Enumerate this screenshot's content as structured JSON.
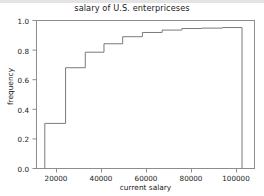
{
  "figure": {
    "width": 264,
    "height": 196,
    "background": "#ffffff",
    "top_band_color": "#e4e4e4"
  },
  "chart_data": {
    "type": "line",
    "title": "salary of U.S. enterpriceses",
    "xlabel": "current salary",
    "ylabel": "frequency",
    "xlim": [
      11000,
      116000
    ],
    "ylim": [
      0.0,
      1.05
    ],
    "grid": false,
    "legend": null,
    "line_color": "#7a7a7a",
    "line_width": 1.0,
    "xticks": [
      20000,
      40000,
      60000,
      80000,
      100000
    ],
    "xtick_labels": [
      "20000",
      "40000",
      "60000",
      "80000",
      "100000"
    ],
    "yticks": [
      0.0,
      0.2,
      0.4,
      0.6,
      0.8,
      1.0
    ],
    "ytick_labels": [
      "0.0",
      "0.2",
      "0.4",
      "0.6",
      "0.8",
      "1.0"
    ],
    "x": [
      15000,
      15000,
      25000,
      25000,
      34500,
      34500,
      43500,
      43500,
      52500,
      52500,
      62000,
      62000,
      71500,
      71500,
      81000,
      81000,
      90500,
      90500,
      100500,
      100500,
      110000,
      110000
    ],
    "y": [
      0.0,
      0.32,
      0.32,
      0.715,
      0.715,
      0.825,
      0.825,
      0.885,
      0.885,
      0.935,
      0.935,
      0.965,
      0.965,
      0.982,
      0.982,
      0.993,
      0.993,
      0.996,
      0.996,
      1.0,
      1.0,
      0.0
    ],
    "steps": [
      {
        "x": 15000,
        "frequency": 0.32
      },
      {
        "x": 25000,
        "frequency": 0.715
      },
      {
        "x": 34500,
        "frequency": 0.825
      },
      {
        "x": 43500,
        "frequency": 0.885
      },
      {
        "x": 52500,
        "frequency": 0.935
      },
      {
        "x": 62000,
        "frequency": 0.965
      },
      {
        "x": 71500,
        "frequency": 0.982
      },
      {
        "x": 81000,
        "frequency": 0.993
      },
      {
        "x": 90500,
        "frequency": 0.996
      },
      {
        "x": 100500,
        "frequency": 1.0
      },
      {
        "x": 110000,
        "frequency": 1.0
      }
    ]
  }
}
